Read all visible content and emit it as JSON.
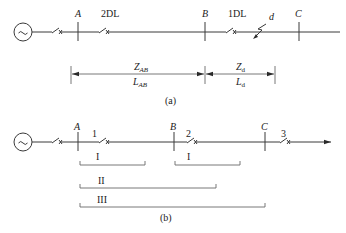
{
  "diagram_a": {
    "caption": "(a)",
    "buses": [
      {
        "id": "A",
        "label": "A"
      },
      {
        "id": "B",
        "label": "B"
      },
      {
        "id": "C",
        "label": "C"
      }
    ],
    "breakers": [
      {
        "label": ""
      },
      {
        "label": "2DL"
      },
      {
        "label": "1DL"
      }
    ],
    "fault": {
      "label": "d"
    },
    "generator_symbol": "~",
    "dimensions": {
      "ab_upper": {
        "main": "Z",
        "sub": "AB"
      },
      "ab_lower": {
        "main": "L",
        "sub": "AB"
      },
      "d_upper": {
        "main": "Z",
        "sub": "d"
      },
      "d_lower": {
        "main": "L",
        "sub": "d"
      }
    }
  },
  "diagram_b": {
    "caption": "(b)",
    "buses": [
      {
        "id": "A",
        "label": "A"
      },
      {
        "id": "B",
        "label": "B"
      },
      {
        "id": "C",
        "label": "C"
      }
    ],
    "breakers": [
      {
        "label": ""
      },
      {
        "label": "1"
      },
      {
        "label": "2"
      },
      {
        "label": "3"
      }
    ],
    "generator_symbol": "~",
    "zones": [
      {
        "label": "I",
        "from": "A",
        "to": "mid-AB"
      },
      {
        "label": "I",
        "from": "B",
        "to": "mid-BC"
      },
      {
        "label": "II",
        "from": "A",
        "to": "beyond-B"
      },
      {
        "label": "III",
        "from": "A",
        "to": "C"
      }
    ]
  }
}
